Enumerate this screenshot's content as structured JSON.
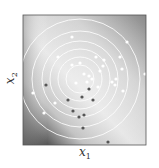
{
  "chart_data": {
    "type": "scatter",
    "title": "",
    "xlabel": "x",
    "xlabel_sub": "1",
    "ylabel": "x",
    "ylabel_sub": "2",
    "background": "grayscale gradient field (dark lower-left, light center-right)",
    "contours": {
      "type": "concentric circles",
      "color": "#ffffff",
      "center_px": [
        80,
        79
      ],
      "radii_px": [
        14,
        22,
        30,
        38,
        48,
        60
      ]
    },
    "series": [
      {
        "name": "light points",
        "color": "#ffffff",
        "points_px": [
          [
            72,
            37
          ],
          [
            127,
            42
          ],
          [
            58,
            57
          ],
          [
            96,
            57
          ],
          [
            104,
            60
          ],
          [
            120,
            57
          ],
          [
            72,
            65
          ],
          [
            80,
            63
          ],
          [
            103,
            66
          ],
          [
            122,
            69
          ],
          [
            100,
            71
          ],
          [
            84,
            74
          ],
          [
            89,
            76
          ],
          [
            76,
            83
          ],
          [
            87,
            82
          ],
          [
            92,
            79
          ],
          [
            116,
            79
          ],
          [
            112,
            82
          ],
          [
            115,
            85
          ],
          [
            33,
            93
          ],
          [
            123,
            91
          ],
          [
            98,
            87
          ],
          [
            55,
            103
          ],
          [
            44,
            113
          ],
          [
            145,
            74
          ]
        ]
      },
      {
        "name": "dark points",
        "color": "#555555",
        "points_px": [
          [
            46,
            85
          ],
          [
            89,
            89
          ],
          [
            82,
            97
          ],
          [
            93,
            100
          ],
          [
            68,
            100
          ],
          [
            73,
            111
          ],
          [
            84,
            115
          ],
          [
            79,
            117
          ],
          [
            83,
            128
          ],
          [
            108,
            142
          ]
        ]
      }
    ]
  }
}
